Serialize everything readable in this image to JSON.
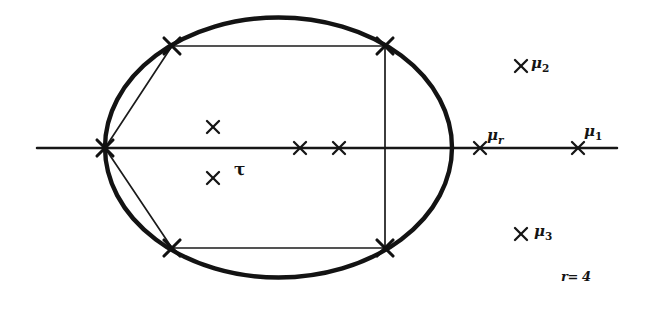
{
  "figure": {
    "background_color": "#ffffff",
    "ink_color": "#141414",
    "width": 646,
    "height": 312,
    "axis": {
      "name": "real-axis",
      "y": 148,
      "x_start": 37,
      "x_end": 617
    },
    "ellipse": {
      "center_x": 278.5,
      "center_y": 147.5,
      "radius_x": 173.5,
      "radius_y": 130.0,
      "stroke_width": 4.4
    },
    "labels": {
      "mu2": {
        "marker": "×",
        "base": "μ",
        "sub": "2"
      },
      "mu_r": {
        "marker": "×",
        "base": "μ",
        "sub": "r"
      },
      "mu1": {
        "marker": "×",
        "base": "μ",
        "sub": "1"
      },
      "mu3": {
        "marker": "×",
        "base": "μ",
        "sub": "3"
      },
      "tau": {
        "text": "τ"
      },
      "r_value": {
        "text": "r= 4"
      }
    },
    "markers": [
      {
        "name": "ellipse-left-vertex",
        "x": 105,
        "y": 148,
        "size": "large"
      },
      {
        "name": "quad-top-left-vertex",
        "x": 172,
        "y": 46,
        "size": "large"
      },
      {
        "name": "quad-top-right-vertex",
        "x": 385,
        "y": 46,
        "size": "large"
      },
      {
        "name": "quad-bottom-left-vertex",
        "x": 172,
        "y": 248,
        "size": "large"
      },
      {
        "name": "quad-bottom-right-vertex",
        "x": 385,
        "y": 248,
        "size": "large"
      },
      {
        "name": "interior-mark-upper",
        "x": 213,
        "y": 127,
        "size": "small"
      },
      {
        "name": "interior-mark-lower",
        "x": 213,
        "y": 178,
        "size": "small"
      },
      {
        "name": "axis-mark-inner-left",
        "x": 300,
        "y": 148,
        "size": "small"
      },
      {
        "name": "axis-mark-inner-right",
        "x": 339,
        "y": 148,
        "size": "small"
      },
      {
        "name": "axis-mark-mu-r",
        "x": 480,
        "y": 148,
        "size": "small"
      },
      {
        "name": "axis-mark-mu-1",
        "x": 578,
        "y": 148,
        "size": "small"
      },
      {
        "name": "mark-mu-2",
        "x": 521,
        "y": 66,
        "size": "small"
      },
      {
        "name": "mark-mu-3",
        "x": 521,
        "y": 234,
        "size": "small"
      }
    ]
  }
}
